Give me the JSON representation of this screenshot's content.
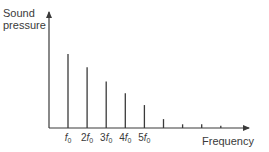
{
  "chart_data": {
    "type": "bar",
    "title": "",
    "ylabel": "Sound pressure",
    "ylabel_lines": [
      "Sound",
      "pressure"
    ],
    "xlabel": "Frequency",
    "harmonics": [
      1,
      2,
      3,
      4,
      5,
      6,
      7,
      8,
      9
    ],
    "values": [
      1.0,
      0.82,
      0.63,
      0.47,
      0.31,
      0.12,
      0.05,
      0.05,
      0.03
    ],
    "tick_labels": [
      {
        "coef": "",
        "sym": "f",
        "sub": "0"
      },
      {
        "coef": "2",
        "sym": "f",
        "sub": "0"
      },
      {
        "coef": "3",
        "sym": "f",
        "sub": "0"
      },
      {
        "coef": "4",
        "sym": "f",
        "sub": "0"
      },
      {
        "coef": "5",
        "sym": "f",
        "sub": "0"
      }
    ],
    "ylim": [
      0,
      1.0
    ],
    "grid": false,
    "legend": "none",
    "stroke_color": "#3a3a3a"
  }
}
